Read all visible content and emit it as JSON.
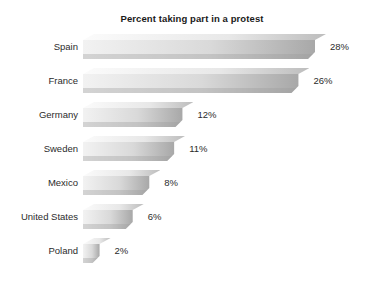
{
  "chart_data": {
    "type": "bar",
    "orientation": "horizontal",
    "title": "Percent taking part in a protest",
    "xlabel": "",
    "ylabel": "",
    "categories": [
      "Spain",
      "France",
      "Germany",
      "Sweden",
      "Mexico",
      "United States",
      "Poland"
    ],
    "values": [
      28,
      26,
      12,
      11,
      8,
      6,
      2
    ],
    "value_labels": [
      "28%",
      "26%",
      "12%",
      "11%",
      "8%",
      "6%",
      "2%"
    ],
    "unit": "%",
    "xlim": [
      0,
      28
    ],
    "grid": false,
    "legend": null,
    "bars": [
      {
        "category": "Spain",
        "value": 28,
        "label": "28%"
      },
      {
        "category": "France",
        "value": 26,
        "label": "26%"
      },
      {
        "category": "Germany",
        "value": 12,
        "label": "12%"
      },
      {
        "category": "Sweden",
        "value": 11,
        "label": "11%"
      },
      {
        "category": "Mexico",
        "value": 8,
        "label": "8%"
      },
      {
        "category": "United States",
        "value": 6,
        "label": "6%"
      },
      {
        "category": "Poland",
        "value": 2,
        "label": "2%"
      }
    ]
  },
  "style": {
    "background": "#ffffff",
    "title_color": "#1a1a1a",
    "label_color": "#2b2b2b",
    "bar_light": "#f2f2f2",
    "bar_mid": "#d9d9d9",
    "bar_dark": "#a8a8a8",
    "bar_top_face": "#e8e8e8",
    "bar_shadow": "#9b9b9b"
  }
}
